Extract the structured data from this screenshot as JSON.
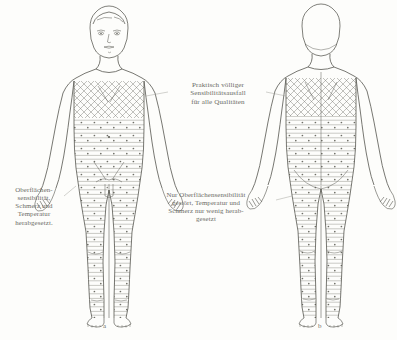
{
  "plate": {
    "kind": "anatomical-line-drawing",
    "view_count": 2,
    "background_color": "#fdfdfb",
    "ink_color": "#55554f",
    "text_color": "#6b6b66"
  },
  "labels": {
    "total_loss": "Praktisch völliger\nSensibilitätsausfall\nfür alle Qualitäten",
    "left_zone": "Oberflächen-\nsensibilität,\nSchmerz und\nTemperatur\nherabgesetzt.",
    "center_zone": "Nur Oberflächensensibilität\ngestört, Temperatur und\nSchmerz nur wenig herab-\ngesetzt"
  },
  "captions": {
    "front": "a",
    "back": "b"
  },
  "figures": [
    {
      "id": "figure-anterior",
      "caption": "a",
      "orientation": "anterior",
      "zones": [
        {
          "name": "crosshatch-trunk",
          "pattern": "cross-hatch"
        },
        {
          "name": "hatched-dotted-lower-body",
          "pattern": "horizontal-lines-with-dots"
        }
      ]
    },
    {
      "id": "figure-posterior",
      "caption": "b",
      "orientation": "posterior",
      "zones": [
        {
          "name": "crosshatch-upper-back",
          "pattern": "cross-hatch"
        },
        {
          "name": "hatched-dotted-lower-body",
          "pattern": "horizontal-lines-with-dots"
        }
      ]
    }
  ]
}
